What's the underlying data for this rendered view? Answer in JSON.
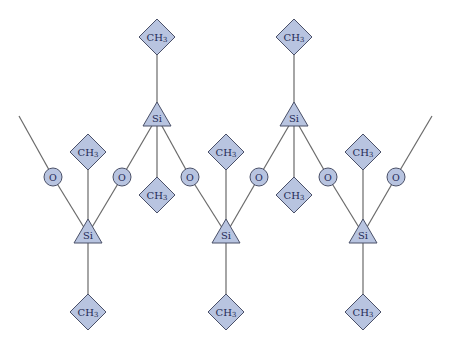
{
  "diagram": {
    "title": "",
    "colors": {
      "node_fill": "#b8c4e0",
      "node_stroke": "#4a5068",
      "bond": "#6a6a6a",
      "label": "#1f2a55"
    },
    "labels": {
      "methyl": "CH",
      "methyl_subscript": "3",
      "silicon": "Si",
      "oxygen": "O"
    },
    "silicon_atoms": [
      {
        "id": "si-top-1",
        "x": 157,
        "y": 117
      },
      {
        "id": "si-top-2",
        "x": 294,
        "y": 117
      },
      {
        "id": "si-bottom-1",
        "x": 88,
        "y": 234
      },
      {
        "id": "si-bottom-2",
        "x": 226,
        "y": 234
      },
      {
        "id": "si-bottom-3",
        "x": 363,
        "y": 234
      }
    ],
    "oxygen_atoms": [
      {
        "id": "o-1",
        "x": 53,
        "y": 177
      },
      {
        "id": "o-2",
        "x": 122,
        "y": 177
      },
      {
        "id": "o-3",
        "x": 190,
        "y": 177
      },
      {
        "id": "o-4",
        "x": 259,
        "y": 177
      },
      {
        "id": "o-5",
        "x": 328,
        "y": 177
      },
      {
        "id": "o-6",
        "x": 396,
        "y": 177
      }
    ],
    "methyl_groups": [
      {
        "id": "ch3-top-1",
        "x": 157,
        "y": 37
      },
      {
        "id": "ch3-top-2",
        "x": 294,
        "y": 37
      },
      {
        "id": "ch3-mid-1",
        "x": 88,
        "y": 152
      },
      {
        "id": "ch3-mid-2",
        "x": 226,
        "y": 152
      },
      {
        "id": "ch3-mid-3",
        "x": 363,
        "y": 152
      },
      {
        "id": "ch3-low-1",
        "x": 157,
        "y": 195
      },
      {
        "id": "ch3-low-2",
        "x": 294,
        "y": 195
      },
      {
        "id": "ch3-bottom-1",
        "x": 88,
        "y": 312
      },
      {
        "id": "ch3-bottom-2",
        "x": 226,
        "y": 312
      },
      {
        "id": "ch3-bottom-3",
        "x": 363,
        "y": 312
      }
    ]
  }
}
